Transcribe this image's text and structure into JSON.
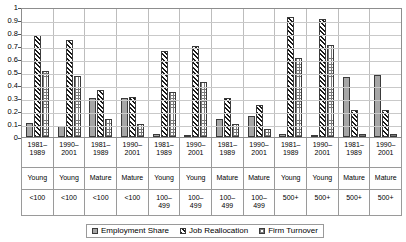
{
  "chart_data": {
    "type": "bar",
    "title": "",
    "xlabel": "",
    "ylabel": "",
    "ylim": [
      0,
      1
    ],
    "ytick_labels": [
      "1",
      "0.9",
      "0.8",
      "0.7",
      "0.6",
      "0.5",
      "0.4",
      "0.3",
      "0.2",
      "0.1",
      "0"
    ],
    "ytick_values": [
      1,
      0.9,
      0.8,
      0.7,
      0.6,
      0.5,
      0.4,
      0.3,
      0.2,
      0.1,
      0
    ],
    "grid": true,
    "legend_position": "bottom",
    "categories": [
      {
        "period": "1981–\n1989",
        "period_line1": "1981–",
        "period_line2": "1989",
        "age": "Young",
        "size": "<100",
        "size_line1": "<100",
        "size_line2": ""
      },
      {
        "period": "1990–\n2001",
        "period_line1": "1990–",
        "period_line2": "2001",
        "age": "Young",
        "size": "<100",
        "size_line1": "<100",
        "size_line2": ""
      },
      {
        "period": "1981–\n1989",
        "period_line1": "1981–",
        "period_line2": "1989",
        "age": "Mature",
        "size": "<100",
        "size_line1": "<100",
        "size_line2": ""
      },
      {
        "period": "1990–\n2001",
        "period_line1": "1990–",
        "period_line2": "2001",
        "age": "Mature",
        "size": "<100",
        "size_line1": "<100",
        "size_line2": ""
      },
      {
        "period": "1981–\n1989",
        "period_line1": "1981–",
        "period_line2": "1989",
        "age": "Young",
        "size": "100–499",
        "size_line1": "100–",
        "size_line2": "499"
      },
      {
        "period": "1990–\n2001",
        "period_line1": "1990–",
        "period_line2": "2001",
        "age": "Young",
        "size": "100–499",
        "size_line1": "100–",
        "size_line2": "499"
      },
      {
        "period": "1981–\n1989",
        "period_line1": "1981–",
        "period_line2": "1989",
        "age": "Mature",
        "size": "100–499",
        "size_line1": "100–",
        "size_line2": "499"
      },
      {
        "period": "1990–\n2001",
        "period_line1": "1990–",
        "period_line2": "2001",
        "age": "Mature",
        "size": "100–499",
        "size_line1": "100–",
        "size_line2": "499"
      },
      {
        "period": "1981–\n1989",
        "period_line1": "1981–",
        "period_line2": "1989",
        "age": "Young",
        "size": "500+",
        "size_line1": "500+",
        "size_line2": ""
      },
      {
        "period": "1990–\n2001",
        "period_line1": "1990–",
        "period_line2": "2001",
        "age": "Young",
        "size": "500+",
        "size_line1": "500+",
        "size_line2": ""
      },
      {
        "period": "1981–\n1989",
        "period_line1": "1981–",
        "period_line2": "1989",
        "age": "Mature",
        "size": "500+",
        "size_line1": "500+",
        "size_line2": ""
      },
      {
        "period": "1990–\n2001",
        "period_line1": "1990–",
        "period_line2": "2001",
        "age": "Mature",
        "size": "500+",
        "size_line1": "500+",
        "size_line2": ""
      }
    ],
    "series": [
      {
        "name": "Employment Share",
        "pattern": "solid-gray",
        "color": "#a6a6a6",
        "values": [
          0.11,
          0.085,
          0.3,
          0.3,
          0.02,
          0.015,
          0.14,
          0.16,
          0.02,
          0.015,
          0.46,
          0.475
        ]
      },
      {
        "name": "Job Reallocation",
        "pattern": "diagonal-hatch",
        "color": "#1a1a1a",
        "values": [
          0.785,
          0.745,
          0.36,
          0.305,
          0.665,
          0.7,
          0.3,
          0.25,
          0.925,
          0.905,
          0.21,
          0.21
        ]
      },
      {
        "name": "Firm Turnover",
        "pattern": "crosshatch-grid",
        "color": "#7a7a7a",
        "values": [
          0.505,
          0.47,
          0.14,
          0.1,
          0.345,
          0.42,
          0.1,
          0.065,
          0.605,
          0.705,
          0.025,
          0.025
        ]
      }
    ]
  },
  "legend": {
    "items": [
      {
        "label": "Employment Share"
      },
      {
        "label": "Job Reallocation"
      },
      {
        "label": "Firm Turnover"
      }
    ]
  }
}
